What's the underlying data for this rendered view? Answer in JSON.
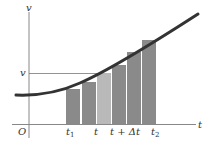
{
  "diagram": {
    "axes": {
      "y_label": "v",
      "x_label": "t",
      "origin_label": "O",
      "color": "#888888"
    },
    "level_marker": {
      "label": "v",
      "y": 73
    },
    "curve": {
      "description": "increasing velocity curve v(t)",
      "color": "#333333"
    },
    "bars": [
      {
        "x": 66,
        "width": 14,
        "top": 89,
        "color": "#8a8a8a"
      },
      {
        "x": 82,
        "width": 14,
        "top": 82,
        "color": "#8a8a8a"
      },
      {
        "x": 97,
        "width": 14,
        "top": 73,
        "color": "#b9b9b9"
      },
      {
        "x": 112,
        "width": 14,
        "top": 65,
        "color": "#8a8a8a"
      },
      {
        "x": 127,
        "width": 14,
        "top": 52,
        "color": "#8a8a8a"
      },
      {
        "x": 142,
        "width": 14,
        "top": 40,
        "color": "#8a8a8a"
      }
    ],
    "tick_labels": [
      {
        "base": "t",
        "sub": "1",
        "x": 66
      },
      {
        "base": "t",
        "sub": "",
        "x": 94
      },
      {
        "base": "t + Δt",
        "sub": "",
        "x": 110
      },
      {
        "base": "t",
        "sub": "2",
        "x": 151
      }
    ]
  }
}
